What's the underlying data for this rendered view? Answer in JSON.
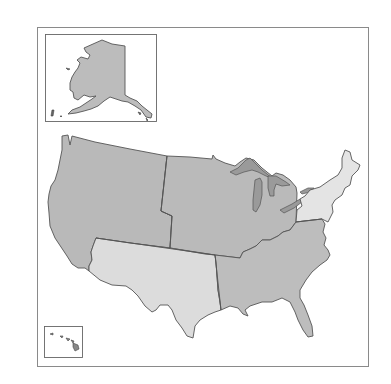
{
  "map": {
    "title": "",
    "subject": "United States regions",
    "colors": {
      "background": "#ffffff",
      "frame": "#8a8a8a",
      "border": "#555555",
      "dark_region": "#b9b9b9",
      "medium_region": "#bdbdbd",
      "light_region": "#dedede",
      "lightest_region": "#e6e6e6",
      "lake": "#9a9a9a"
    },
    "regions": [
      {
        "id": "west",
        "name": "West",
        "shade": "dark"
      },
      {
        "id": "midwest",
        "name": "Midwest",
        "shade": "dark"
      },
      {
        "id": "southwest",
        "name": "Southwest",
        "shade": "light"
      },
      {
        "id": "southeast",
        "name": "Southeast",
        "shade": "medium"
      },
      {
        "id": "northeast",
        "name": "Northeast",
        "shade": "lightest"
      }
    ],
    "insets": [
      {
        "id": "alaska",
        "name": "Alaska",
        "region": "west"
      },
      {
        "id": "hawaii",
        "name": "Hawaii",
        "region": "west"
      }
    ]
  }
}
